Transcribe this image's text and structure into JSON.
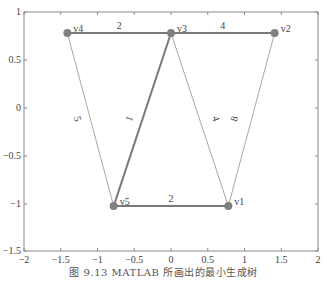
{
  "chart_data": {
    "type": "graph",
    "title": "",
    "xlabel": "",
    "ylabel": "",
    "xlim": [
      -2,
      2
    ],
    "ylim": [
      -1.5,
      1
    ],
    "grid": false,
    "x_ticks": [
      "-2",
      "-1.5",
      "-1",
      "-0.5",
      "0",
      "0.5",
      "1",
      "1.5",
      "2"
    ],
    "y_ticks": [
      "-1.5",
      "-1",
      "-0.5",
      "0",
      "0.5",
      "1"
    ],
    "nodes": [
      {
        "id": "v1",
        "label": "v1",
        "x": 0.78,
        "y": -1.03
      },
      {
        "id": "v2",
        "label": "v2",
        "x": 1.41,
        "y": 0.78
      },
      {
        "id": "v3",
        "label": "v3",
        "x": 0.0,
        "y": 0.78
      },
      {
        "id": "v4",
        "label": "v4",
        "x": -1.41,
        "y": 0.78
      },
      {
        "id": "v5",
        "label": "v5",
        "x": -0.78,
        "y": -1.03
      }
    ],
    "edges": [
      {
        "from": "v4",
        "to": "v3",
        "weight": "2",
        "in_tree": true
      },
      {
        "from": "v3",
        "to": "v2",
        "weight": "4",
        "in_tree": true
      },
      {
        "from": "v3",
        "to": "v5",
        "weight": "1",
        "in_tree": true
      },
      {
        "from": "v5",
        "to": "v1",
        "weight": "2",
        "in_tree": true
      },
      {
        "from": "v4",
        "to": "v5",
        "weight": "5",
        "in_tree": false
      },
      {
        "from": "v3",
        "to": "v1",
        "weight": "4",
        "in_tree": false
      },
      {
        "from": "v2",
        "to": "v1",
        "weight": "8",
        "in_tree": false
      }
    ],
    "colors": {
      "tree_edge": "#7a7a7a",
      "other_edge": "#a8a8a8",
      "node": "#808080",
      "axis": "#8a8a8a"
    }
  },
  "axes": {
    "x_ticks": [
      {
        "label": "-2",
        "px": 24
      },
      {
        "label": "-1.5",
        "px": 60.75
      },
      {
        "label": "-1",
        "px": 97.5
      },
      {
        "label": "-0.5",
        "px": 134.25
      },
      {
        "label": "0",
        "px": 171
      },
      {
        "label": "0.5",
        "px": 207.75
      },
      {
        "label": "1",
        "px": 244.5
      },
      {
        "label": "1.5",
        "px": 281.25
      },
      {
        "label": "2",
        "px": 318
      }
    ],
    "y_ticks": [
      {
        "label": "1",
        "py": 12
      },
      {
        "label": "0.5",
        "py": 60
      },
      {
        "label": "0",
        "py": 108
      },
      {
        "label": "-0.5",
        "py": 156
      },
      {
        "label": "-1",
        "py": 204
      },
      {
        "label": "-1.5",
        "py": 251
      }
    ]
  },
  "caption": "图 9.13   MATLAB 所画出的最小生成树"
}
